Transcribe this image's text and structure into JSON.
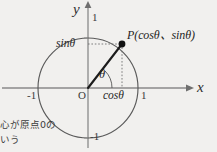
{
  "figure": {
    "title_semantic": "unit-circle-trigonometry-diagram",
    "background_color": "#f1f0ee",
    "ink_color": "#2a2a2a",
    "axes": {
      "x_label": "x",
      "y_label": "y",
      "x_ticks": [
        "-1",
        "1"
      ],
      "y_ticks": [
        "1",
        "-1"
      ],
      "origin_label": "O"
    },
    "circle": {
      "center_x": 88,
      "center_y": 88,
      "radius": 50,
      "stroke_color": "#555555"
    },
    "point": {
      "name": "P",
      "label": "P(cosθ、sinθ)",
      "x": 122,
      "y": 44
    },
    "angle": {
      "symbol": "θ",
      "vertex_x": 88,
      "vertex_y": 88
    },
    "projections": {
      "sin_label": "sinθ",
      "cos_label": "cosθ"
    }
  },
  "caption": {
    "line1": "心が原点0の",
    "line2": "いう"
  }
}
